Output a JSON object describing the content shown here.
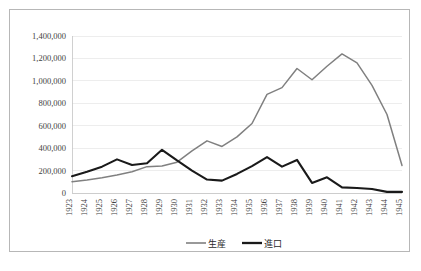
{
  "chart_data": {
    "type": "line",
    "title": "",
    "xlabel": "",
    "ylabel": "",
    "x": [
      1923,
      1924,
      1925,
      1926,
      1927,
      1928,
      1929,
      1930,
      1931,
      1932,
      1933,
      1934,
      1935,
      1936,
      1937,
      1938,
      1939,
      1940,
      1941,
      1942,
      1943,
      1944,
      1945
    ],
    "categories": [
      "1923",
      "1924",
      "1925",
      "1926",
      "1927",
      "1928",
      "1929",
      "1930",
      "1931",
      "1932",
      "1933",
      "1934",
      "1935",
      "1936",
      "1937",
      "1938",
      "1939",
      "1940",
      "1941",
      "1942",
      "1943",
      "1944",
      "1945"
    ],
    "series": [
      {
        "name": "生産",
        "color": "#808080",
        "values": [
          100000,
          115000,
          135000,
          160000,
          190000,
          235000,
          240000,
          275000,
          375000,
          465000,
          415000,
          500000,
          620000,
          880000,
          940000,
          1110000,
          1010000,
          1130000,
          1240000,
          1160000,
          960000,
          700000,
          245000
        ]
      },
      {
        "name": "進口",
        "color": "#1a1a1a",
        "values": [
          150000,
          190000,
          235000,
          300000,
          250000,
          265000,
          385000,
          290000,
          200000,
          120000,
          110000,
          170000,
          240000,
          320000,
          235000,
          295000,
          90000,
          140000,
          50000,
          45000,
          35000,
          10000,
          10000
        ]
      }
    ],
    "ylim": [
      0,
      1400000
    ],
    "ytick_values": [
      0,
      200000,
      400000,
      600000,
      800000,
      1000000,
      1200000,
      1400000
    ],
    "ytick_labels": [
      "0",
      "200,000",
      "400,000",
      "600,000",
      "800,000",
      "1,000,000",
      "1,200,000",
      "1,400,000"
    ],
    "grid": "horizontal",
    "legend_position": "bottom-center"
  },
  "legend": {
    "items": [
      {
        "label": "生産"
      },
      {
        "label": "進口"
      }
    ]
  },
  "colors": {
    "production_line": "#808080",
    "import_line": "#1a1a1a",
    "gridline": "#e6e6e6",
    "frame_border": "#b7b7b7",
    "background": "#ffffff",
    "tick_text": "#3f3f3f"
  }
}
